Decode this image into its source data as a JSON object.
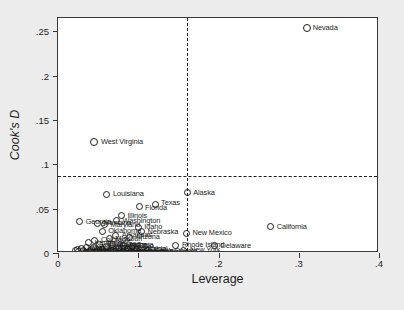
{
  "chart_data": {
    "type": "scatter",
    "title": "",
    "xlabel": "Leverage",
    "ylabel": "Cook's D",
    "xlim": [
      0,
      0.4
    ],
    "ylim": [
      0,
      0.265
    ],
    "xticks": [
      "0",
      ".1",
      ".2",
      ".3",
      ".4"
    ],
    "xtickvals": [
      0,
      0.1,
      0.2,
      0.3,
      0.4
    ],
    "yticks": [
      "0",
      ".05",
      ".1",
      ".15",
      ".2",
      ".25"
    ],
    "ytickvals": [
      0,
      0.05,
      0.1,
      0.15,
      0.2,
      0.25
    ],
    "grid": false,
    "legend": "none",
    "marker_style": "hollow-circle",
    "reference_lines": [
      {
        "orientation": "horizontal",
        "value": 0.0865,
        "style": "dashed"
      },
      {
        "orientation": "vertical",
        "value": 0.161,
        "style": "dashed"
      }
    ],
    "points": [
      {
        "label": "Nevada",
        "x": 0.31,
        "y": 0.254,
        "lx": 6,
        "ly": 0
      },
      {
        "label": "West Virginia",
        "x": 0.045,
        "y": 0.125,
        "lx": 7,
        "ly": 0
      },
      {
        "label": "Alaska",
        "x": 0.161,
        "y": 0.068,
        "lx": 6,
        "ly": 0
      },
      {
        "label": "Louisiana",
        "x": 0.061,
        "y": 0.066,
        "lx": 6,
        "ly": 0
      },
      {
        "label": "Texas",
        "x": 0.121,
        "y": 0.055,
        "lx": 6,
        "ly": -1
      },
      {
        "label": "Florida",
        "x": 0.101,
        "y": 0.052,
        "lx": 6,
        "ly": 1
      },
      {
        "label": "Illinois",
        "x": 0.079,
        "y": 0.042,
        "lx": 6,
        "ly": 0
      },
      {
        "label": "Washington",
        "x": 0.073,
        "y": 0.037,
        "lx": 6,
        "ly": 1
      },
      {
        "label": "California",
        "x": 0.265,
        "y": 0.0295,
        "lx": 6,
        "ly": 0
      },
      {
        "label": "Georgia",
        "x": 0.027,
        "y": 0.035,
        "lx": 6,
        "ly": 0
      },
      {
        "label": "Montana",
        "x": 0.049,
        "y": 0.0335,
        "lx": 6,
        "ly": 0
      },
      {
        "label": "Maryland",
        "x": 0.058,
        "y": 0.032,
        "lx": 6,
        "ly": 0
      },
      {
        "label": "Idaho",
        "x": 0.1,
        "y": 0.029,
        "lx": 6,
        "ly": 0
      },
      {
        "label": "Nebraska",
        "x": 0.104,
        "y": 0.024,
        "lx": 6,
        "ly": 0
      },
      {
        "label": "Oklahoma",
        "x": 0.055,
        "y": 0.0245,
        "lx": 6,
        "ly": 0
      },
      {
        "label": "New Mexico",
        "x": 0.16,
        "y": 0.022,
        "lx": 6,
        "ly": 0
      },
      {
        "label": "Arkansas",
        "x": 0.072,
        "y": 0.02,
        "lx": 6,
        "ly": 0
      },
      {
        "label": "Arizona",
        "x": 0.089,
        "y": 0.0175,
        "lx": 6,
        "ly": 0
      },
      {
        "label": "Missouri",
        "x": 0.064,
        "y": 0.016,
        "lx": 6,
        "ly": 0
      },
      {
        "label": "Colorado",
        "x": 0.046,
        "y": 0.0145,
        "lx": 6,
        "ly": 0
      },
      {
        "label": "Delaware",
        "x": 0.195,
        "y": 0.008,
        "lx": 6,
        "ly": 0
      },
      {
        "label": "Rhode Island",
        "x": 0.147,
        "y": 0.0085,
        "lx": 6,
        "ly": 0
      },
      {
        "label": "New York",
        "x": 0.157,
        "y": 0.003,
        "lx": 6,
        "ly": 0
      },
      {
        "label": "South Dakota",
        "x": 0.112,
        "y": 0.0025,
        "lx": 6,
        "ly": 0
      },
      {
        "label": "Kentucky",
        "x": 0.038,
        "y": 0.0115,
        "lx": 6,
        "ly": 0
      },
      {
        "label": "Tennessee",
        "x": 0.052,
        "y": 0.01,
        "lx": 6,
        "ly": 0
      },
      {
        "label": "Alabama",
        "x": 0.068,
        "y": 0.0095,
        "lx": 6,
        "ly": 0
      },
      {
        "label": "Indiana",
        "x": 0.082,
        "y": 0.0085,
        "lx": 6,
        "ly": 0
      },
      {
        "label": "Ohio",
        "x": 0.093,
        "y": 0.0075,
        "lx": 6,
        "ly": 0
      },
      {
        "label": "Michigan",
        "x": 0.061,
        "y": 0.007,
        "lx": 6,
        "ly": 0
      },
      {
        "label": "Wisconsin",
        "x": 0.044,
        "y": 0.0065,
        "lx": 6,
        "ly": 0
      },
      {
        "label": "Minnesota",
        "x": 0.035,
        "y": 0.006,
        "lx": 6,
        "ly": 0
      },
      {
        "label": "Iowa",
        "x": 0.029,
        "y": 0.0055,
        "lx": 6,
        "ly": 0
      },
      {
        "label": "Kansas",
        "x": 0.076,
        "y": 0.005,
        "lx": 6,
        "ly": 0
      },
      {
        "label": "Mississippi",
        "x": 0.086,
        "y": 0.0045,
        "lx": 6,
        "ly": 0
      },
      {
        "label": "Virginia",
        "x": 0.098,
        "y": 0.004,
        "lx": 6,
        "ly": 0
      },
      {
        "label": "Oregon",
        "x": 0.056,
        "y": 0.0035,
        "lx": 6,
        "ly": 0
      },
      {
        "label": "Utah",
        "x": 0.041,
        "y": 0.003,
        "lx": 6,
        "ly": 0
      },
      {
        "label": "Maine",
        "x": 0.032,
        "y": 0.0025,
        "lx": 6,
        "ly": 0
      },
      {
        "label": "Vermont",
        "x": 0.025,
        "y": 0.002,
        "lx": 6,
        "ly": 0
      },
      {
        "label": "Wyoming",
        "x": 0.022,
        "y": 0.0028,
        "lx": 6,
        "ly": 0
      },
      {
        "label": "Hawaii",
        "x": 0.066,
        "y": 0.0018,
        "lx": 6,
        "ly": 0
      },
      {
        "label": "Connecticut",
        "x": 0.05,
        "y": 0.0015,
        "lx": 6,
        "ly": 0
      },
      {
        "label": "New Jersey",
        "x": 0.071,
        "y": 0.0013,
        "lx": 6,
        "ly": 0
      },
      {
        "label": "Pennsylvania",
        "x": 0.09,
        "y": 0.0012,
        "lx": 6,
        "ly": 0
      },
      {
        "label": "New Hampshire",
        "x": 0.036,
        "y": 0.001,
        "lx": 6,
        "ly": 0
      },
      {
        "label": "Massachusetts",
        "x": 0.06,
        "y": 0.0008,
        "lx": 6,
        "ly": 0
      },
      {
        "label": "North Dakota",
        "x": 0.107,
        "y": 0.0007,
        "lx": 6,
        "ly": 0
      },
      {
        "label": "North Carolina",
        "x": 0.079,
        "y": 0.0006,
        "lx": 6,
        "ly": 0
      },
      {
        "label": "South Carolina",
        "x": 0.047,
        "y": 0.0005,
        "lx": 6,
        "ly": 0
      },
      {
        "label": "  ",
        "x": 0.024,
        "y": 0.004,
        "lx": 6,
        "ly": 0
      }
    ]
  }
}
